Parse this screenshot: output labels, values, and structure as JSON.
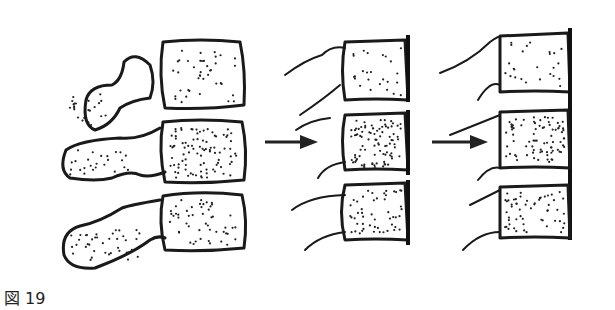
{
  "figure": {
    "caption": "図 19",
    "panels": [
      {
        "id": "stage-1",
        "description": "normal lumbar vertebrae with posterior elements"
      },
      {
        "id": "stage-2",
        "description": "vertebrae with degenerated posterior elements"
      },
      {
        "id": "stage-3",
        "description": "further degeneration"
      }
    ],
    "arrows": [
      {
        "from": "stage-1",
        "to": "stage-2"
      },
      {
        "from": "stage-2",
        "to": "stage-3"
      }
    ]
  }
}
